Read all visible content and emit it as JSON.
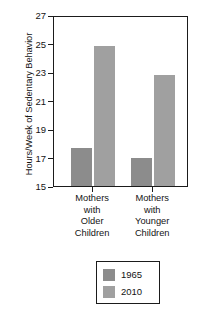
{
  "chart_data": {
    "type": "bar",
    "title": "",
    "xlabel": "",
    "ylabel": "Hours/Week of Sedentary Behavior",
    "ylim": [
      15,
      27
    ],
    "yticks": [
      15,
      17,
      19,
      21,
      23,
      25,
      27
    ],
    "ytick_labels": [
      "15",
      "17",
      "19",
      "21",
      "23",
      "25",
      "27"
    ],
    "grid": false,
    "legend_position": "bottom-center",
    "categories": [
      "Mothers with Older Children",
      "Mothers with Younger Children"
    ],
    "category_lines": [
      [
        "Mothers",
        "with",
        "Older",
        "Children"
      ],
      [
        "Mothers",
        "with",
        "Younger",
        "Children"
      ]
    ],
    "series": [
      {
        "name": "1965",
        "color": "#8c8c8c",
        "values": [
          17.7,
          17.0
        ]
      },
      {
        "name": "2010",
        "color": "#a0a0a0",
        "values": [
          24.8,
          22.8
        ]
      }
    ]
  },
  "legend": {
    "items": [
      {
        "label": "1965",
        "color": "#8c8c8c"
      },
      {
        "label": "2010",
        "color": "#a0a0a0"
      }
    ]
  },
  "axis": {
    "frame_color": "#1b1b1b",
    "text_color": "#141414"
  }
}
